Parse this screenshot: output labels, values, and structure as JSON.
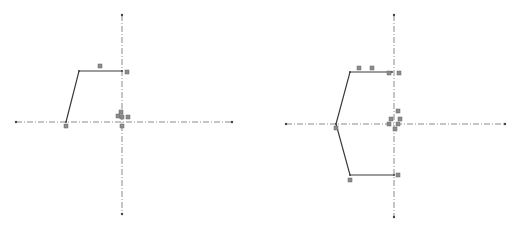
{
  "sketches": [
    {
      "name": "left-sketch",
      "axes": {
        "horizontal": {
          "x1": 16,
          "x2": 232,
          "y": 122
        },
        "vertical": {
          "x": 122,
          "y1": 15,
          "y2": 214
        }
      },
      "profile": [
        [
          66,
          122
        ],
        [
          79,
          71
        ],
        [
          122,
          71
        ]
      ],
      "constraint_markers": [
        [
          100,
          66
        ],
        [
          127,
          72
        ],
        [
          66,
          126
        ],
        [
          121,
          112
        ],
        [
          118,
          116
        ],
        [
          122,
          117
        ],
        [
          128,
          117
        ],
        [
          122,
          126
        ]
      ]
    },
    {
      "name": "right-sketch",
      "axes": {
        "horizontal": {
          "x1": 286,
          "x2": 505,
          "y": 124
        },
        "vertical": {
          "x": 394,
          "y1": 15,
          "y2": 217
        }
      },
      "profile": [
        [
          392,
          72
        ],
        [
          350,
          72
        ],
        [
          336,
          124
        ],
        [
          350,
          175
        ],
        [
          394,
          175
        ]
      ],
      "constraint_markers": [
        [
          359,
          68
        ],
        [
          372,
          68
        ],
        [
          389,
          73
        ],
        [
          399,
          73
        ],
        [
          336,
          128
        ],
        [
          350,
          180
        ],
        [
          398,
          175
        ],
        [
          398,
          111
        ],
        [
          391,
          119
        ],
        [
          400,
          119
        ],
        [
          389,
          124
        ],
        [
          398,
          124
        ],
        [
          395,
          129
        ]
      ]
    }
  ],
  "colors": {
    "axis": "#8a8a8a",
    "edge": "#3a3a3a",
    "marker": "#8c8c8c",
    "background": "#ffffff"
  }
}
